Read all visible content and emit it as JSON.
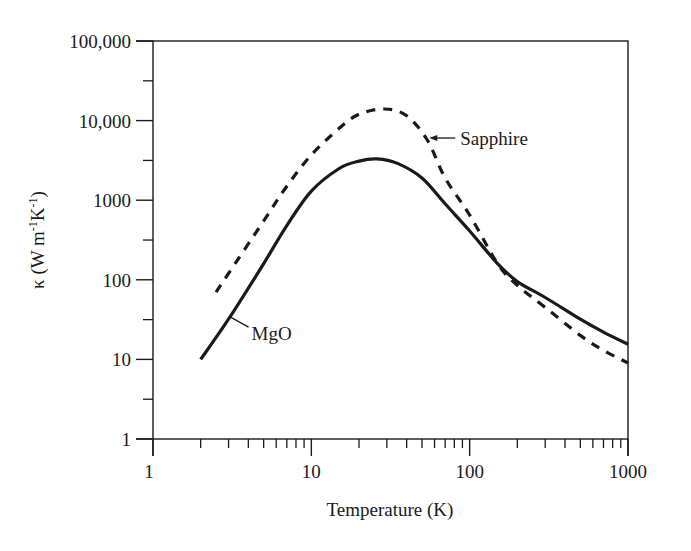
{
  "chart_data": {
    "type": "line",
    "title": "",
    "xlabel": "Temperature (K)",
    "ylabel": "κ (W m⁻¹K⁻¹)",
    "xscale": "log",
    "yscale": "log",
    "xlim": [
      1,
      1000
    ],
    "ylim": [
      1,
      100000
    ],
    "x_ticks": [
      1,
      10,
      100,
      1000
    ],
    "x_tick_labels": [
      "1",
      "10",
      "100",
      "1000"
    ],
    "y_ticks": [
      1,
      10,
      100,
      1000,
      10000,
      100000
    ],
    "y_tick_labels": [
      "1",
      "10",
      "100",
      "1000",
      "10,000",
      "100,000"
    ],
    "grid": false,
    "legend": "none (inline annotations)",
    "series": [
      {
        "name": "MgO",
        "style": "solid",
        "x": [
          2,
          3,
          5,
          7,
          10,
          15,
          20,
          26,
          35,
          50,
          70,
          100,
          150,
          200,
          300,
          500,
          700,
          1000
        ],
        "y": [
          10,
          32,
          160,
          480,
          1300,
          2500,
          3100,
          3300,
          2900,
          1900,
          900,
          410,
          160,
          95,
          60,
          32,
          22,
          15.5
        ]
      },
      {
        "name": "Sapphire",
        "style": "dashed",
        "x": [
          2.5,
          3,
          5,
          7,
          10,
          15,
          20,
          29,
          40,
          54,
          70,
          100,
          150,
          200,
          300,
          500,
          700,
          1000
        ],
        "y": [
          70,
          120,
          550,
          1500,
          3700,
          8000,
          12000,
          14000,
          11500,
          5700,
          1900,
          650,
          160,
          85,
          45,
          20,
          13,
          9
        ]
      }
    ],
    "annotations": [
      {
        "text": "Sapphire",
        "target_series": "Sapphire",
        "type": "arrow",
        "at": [
          54,
          5700
        ]
      },
      {
        "text": "MgO",
        "target_series": "MgO",
        "type": "leader-line",
        "at": [
          3,
          32
        ]
      }
    ]
  },
  "labels": {
    "xlabel": "Temperature (K)",
    "ylabel_prefix": "κ (W m",
    "ylabel_sup1": "-1",
    "ylabel_mid": "K",
    "ylabel_sup2": "-1",
    "ylabel_suffix": ")",
    "sapphire": "Sapphire",
    "mgo": "MgO"
  },
  "colors": {
    "ink": "#1a1a1a",
    "background": "#ffffff"
  }
}
